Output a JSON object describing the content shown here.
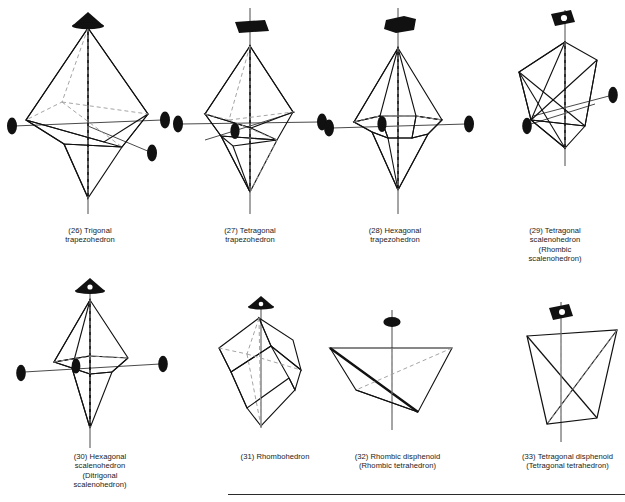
{
  "plate": {
    "background_color": "#ffffff",
    "ink_color": "#111111",
    "dashed_color": "#9a9a9a",
    "axis_line_color": "#4a4a4a",
    "bottom_rule": true
  },
  "axis_symbols": {
    "twofold": "lens-filled",
    "threefold": "triangle-filled",
    "fourfold": "square-filled",
    "sixfold": "hexagon-filled",
    "threefold_inversion": "triangle-open-center",
    "fourfold_inversion": "square-open-center"
  },
  "figures": [
    {
      "number": "(26)",
      "name": "Trigonal trapezohedron",
      "caption": "(26) Trigonal\ntrapezohedron",
      "principal_axis": "threefold",
      "secondary_axes": 3,
      "secondary_axis_symbol": "twofold"
    },
    {
      "number": "(27)",
      "name": "Tetragonal trapezohedron",
      "caption": "(27) Tetragonal\ntrapezohedron",
      "principal_axis": "fourfold",
      "secondary_axes": 4,
      "secondary_axis_symbol": "twofold"
    },
    {
      "number": "(28)",
      "name": "Hexagonal trapezohedron",
      "caption": "(28) Hexagonal\ntrapezohedron",
      "principal_axis": "sixfold",
      "secondary_axes": 3,
      "secondary_axis_symbol": "twofold"
    },
    {
      "number": "(29)",
      "name": "Tetragonal scalenohedron",
      "caption": "(29) Tetragonal\nscalenohedron\n(Rhombic\nscalenohedron)",
      "principal_axis": "fourfold_inversion",
      "secondary_axes": 2,
      "secondary_axis_symbol": "twofold"
    },
    {
      "number": "(30)",
      "name": "Hexagonal scalenohedron",
      "caption": "(30) Hexagonal\nscalenohedron\n(Ditrigonal\nscalenohedron)",
      "principal_axis": "threefold_inversion",
      "secondary_axes": 3,
      "secondary_axis_symbol": "twofold"
    },
    {
      "number": "(31)",
      "name": "Rhombohedron",
      "caption": "(31) Rhombohedron",
      "principal_axis": "threefold_inversion",
      "secondary_axes": 0,
      "secondary_axis_symbol": "none"
    },
    {
      "number": "(32)",
      "name": "Rhombic disphenoid",
      "caption": "(32) Rhombic disphenoid\n(Rhombic tetrahedron)",
      "principal_axis": "twofold",
      "secondary_axes": 0,
      "secondary_axis_symbol": "none"
    },
    {
      "number": "(33)",
      "name": "Tetragonal disphenoid",
      "caption": "(33) Tetragonal disphenoid\n(Tetragonal tetrahedron)",
      "principal_axis": "fourfold_inversion",
      "secondary_axes": 0,
      "secondary_axis_symbol": "none"
    }
  ]
}
